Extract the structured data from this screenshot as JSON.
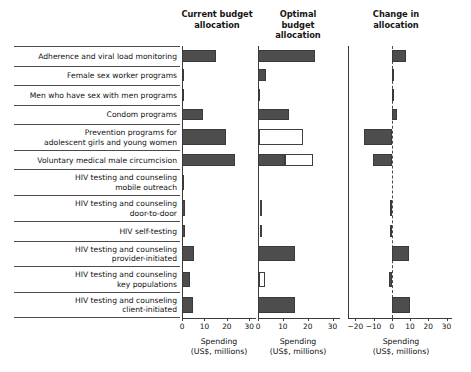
{
  "headers": {
    "current": "Current budget\nallocation",
    "current_l1": "Current budget",
    "current_l2": "allocation",
    "optimal_l1": "Optimal budget",
    "optimal_l2": "allocation",
    "change_l1": "Change in",
    "change_l2": "allocation"
  },
  "axis_caption": {
    "line1": "Spending",
    "line2": "(US$, millions)"
  },
  "chart_data": {
    "type": "bar",
    "title": "",
    "orientation": "horizontal",
    "xlabel": "Spending (US$, millions)",
    "ylabel": "",
    "grid": false,
    "legend": "none",
    "panels": [
      {
        "name": "current-budget-allocation",
        "title_line1": "Current budget",
        "title_line2": "allocation",
        "xlim": [
          0,
          33
        ],
        "xticks": [
          0,
          10,
          20,
          30
        ],
        "xticklabels": [
          "0",
          "10",
          "20",
          "30"
        ],
        "series": [
          {
            "name": "Current allocation",
            "style": "solid",
            "values": [
              15.3,
              0.6,
              0.2,
              9.5,
              19.5,
              23.8,
              0.15,
              1.5,
              1.4,
              5.2,
              3.6,
              4.8
            ]
          }
        ]
      },
      {
        "name": "optimal-budget-allocation",
        "title_line1": "Optimal budget",
        "title_line2": "allocation",
        "xlim": [
          0,
          33
        ],
        "xticks": [
          0,
          10,
          20,
          30
        ],
        "xticklabels": [
          "0",
          "10",
          "20",
          "30"
        ],
        "series": [
          {
            "name": "Optimal allocation (funded)",
            "style": "solid",
            "values": [
              23.0,
              3.3,
              0.4,
              12.3,
              0.0,
              11.0,
              0.0,
              0.0,
              0.0,
              14.8,
              0.0,
              14.7
            ]
          },
          {
            "name": "Optimal allocation (unfunded)",
            "style": "hollow",
            "start": [
              0,
              0,
              0,
              0,
              0.3,
              11.0,
              0,
              0.7,
              0.7,
              0,
              0.6,
              0
            ],
            "values": [
              0.0,
              0.0,
              0.0,
              0.0,
              17.7,
              11.2,
              0.0,
              1.1,
              1.0,
              0.0,
              2.4,
              0.0
            ]
          }
        ]
      },
      {
        "name": "change-in-allocation",
        "title_line1": "Change in",
        "title_line2": "allocation",
        "xlim": [
          -24,
          33
        ],
        "xticks": [
          -20,
          -10,
          0,
          10,
          20,
          30
        ],
        "xticklabels": [
          "−20",
          "−10",
          "0",
          "10",
          "20",
          "30"
        ],
        "series": [
          {
            "name": "Change",
            "style": "solid",
            "values": [
              7.7,
              1.3,
              0.2,
              2.8,
              -15.1,
              -10.5,
              0.0,
              -0.9,
              -0.8,
              9.6,
              -1.3,
              9.9
            ]
          }
        ]
      }
    ],
    "categories": [
      {
        "id": "adherence-viral-load-monitoring",
        "lines": [
          "Adherence and viral load monitoring"
        ]
      },
      {
        "id": "female-sex-worker-programs",
        "lines": [
          "Female sex worker programs"
        ]
      },
      {
        "id": "men-who-have-sex-with-men-programs",
        "lines": [
          "Men who have sex with men programs"
        ]
      },
      {
        "id": "condom-programs",
        "lines": [
          "Condom programs"
        ]
      },
      {
        "id": "prevention-programs-adolescent-girls",
        "lines": [
          "Prevention programs for",
          "adolescent girls and young women"
        ]
      },
      {
        "id": "voluntary-medical-male-circumcision",
        "lines": [
          "Voluntary medical male circumcision"
        ]
      },
      {
        "id": "hiv-testing-counseling-mobile-outreach",
        "lines": [
          "HIV testing and counseling",
          "mobile outreach"
        ]
      },
      {
        "id": "hiv-testing-counseling-door-to-door",
        "lines": [
          "HIV testing and counseling",
          "door-to-door"
        ]
      },
      {
        "id": "hiv-self-testing",
        "lines": [
          "HIV self-testing"
        ]
      },
      {
        "id": "hiv-testing-counseling-provider-initiated",
        "lines": [
          "HIV testing and counseling",
          "provider-initiated"
        ]
      },
      {
        "id": "hiv-testing-counseling-key-populations",
        "lines": [
          "HIV testing and counseling",
          "key populations"
        ]
      },
      {
        "id": "hiv-testing-counseling-client-initiated",
        "lines": [
          "HIV testing and counseling",
          "client-initiated"
        ]
      }
    ],
    "colors": {
      "bar_fill": "#4d4d4d",
      "bar_stroke": "#3a3a3a",
      "hollow_fill": "#ffffff",
      "axis": "#3a3a3a",
      "text": "#111111"
    }
  }
}
